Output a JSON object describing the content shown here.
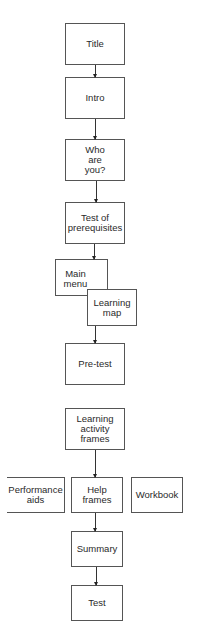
{
  "diagram": {
    "type": "flowchart",
    "nodes": {
      "title": "Title",
      "intro": "Intro",
      "who_are_you": "Who are you?",
      "test_prereq": "Test of prerequisites",
      "main_menu": "Main menu",
      "learning_map": "Learning map",
      "pre_test": "Pre-test",
      "learning_activity": "Learning activity frames",
      "performance_aids": "Performance aids",
      "help_frames": "Help frames",
      "workbook": "Workbook",
      "summary": "Summary",
      "test": "Test"
    },
    "edges": [
      [
        "Title",
        "Intro"
      ],
      [
        "Intro",
        "Who are you?"
      ],
      [
        "Who are you?",
        "Test of prerequisites"
      ],
      [
        "Test of prerequisites",
        "Main menu"
      ],
      [
        "Learning map",
        "Pre-test"
      ],
      [
        "Learning activity frames",
        "Help frames"
      ],
      [
        "Help frames",
        "Summary"
      ],
      [
        "Summary",
        "Test"
      ]
    ]
  }
}
